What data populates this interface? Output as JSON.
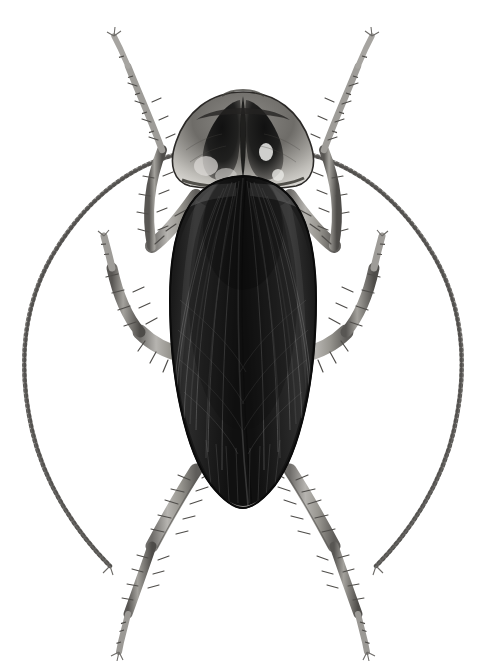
{
  "figure": {
    "kind": "scientific-illustration",
    "subject": "cockroach",
    "common_name": "American cockroach",
    "view": "dorsal",
    "technique": "grayscale stipple and line engraving",
    "background_color": "#ffffff",
    "canvas": {
      "width": 486,
      "height": 664
    },
    "alt_text": "Grayscale naturalist illustration of a cockroach seen from above, with long sweeping antennae, six spiny legs, a shield-like pronotum and dark folded wings covering the abdomen."
  },
  "palette": {
    "background": "#ffffff",
    "wing_darkest": "#141414",
    "wing_dark": "#242424",
    "wing_mid": "#3a3a3a",
    "wing_highlight": "#6a6a6a",
    "pronotum_dark": "#2a2a2a",
    "pronotum_mid": "#777777",
    "pronotum_pale": "#d8d6d2",
    "leg_mid": "#8e8c89",
    "leg_dark": "#4a4845",
    "leg_pale": "#c9c7c3",
    "antenna": "#8a8885",
    "outline": "#1a1a1a"
  },
  "anatomy": {
    "parts": [
      {
        "id": "antenna-left",
        "label": "Left antenna",
        "note": "Long, finely annulated, arcs down and outward to the lower left"
      },
      {
        "id": "antenna-right",
        "label": "Right antenna",
        "note": "Long, finely annulated, arcs down and outward to the lower right"
      },
      {
        "id": "head",
        "label": "Head",
        "note": "Largely concealed beneath the pronotum"
      },
      {
        "id": "pronotum",
        "label": "Pronotum",
        "note": "Shield-shaped, dark butterfly-like central marking with pale margins"
      },
      {
        "id": "tegmina",
        "label": "Tegmina (forewings)",
        "note": "Dark overlapping leathery forewings covering the abdomen, rounded apex"
      },
      {
        "id": "wing-venation",
        "label": "Wing venation",
        "note": "Fine longitudinal veins radiating toward the wing apex"
      },
      {
        "id": "leg-fore-left",
        "label": "Left foreleg",
        "note": "Raised forward, tarsus crossing the left antenna"
      },
      {
        "id": "leg-fore-right",
        "label": "Right foreleg",
        "note": "Raised forward, tarsus crossing the right antenna"
      },
      {
        "id": "leg-mid-left",
        "label": "Left midleg",
        "note": "Spiny femur and tibia directed outward and down"
      },
      {
        "id": "leg-mid-right",
        "label": "Right midleg",
        "note": "Spiny femur and tibia directed outward and down"
      },
      {
        "id": "leg-hind-left",
        "label": "Left hindleg",
        "note": "Longest leg, spiny tibia, five-segmented tarsus"
      },
      {
        "id": "leg-hind-right",
        "label": "Right hindleg",
        "note": "Longest leg, spiny tibia, five-segmented tarsus"
      }
    ]
  }
}
